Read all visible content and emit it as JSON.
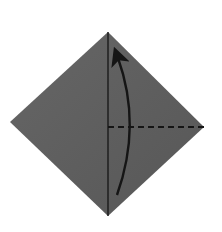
{
  "diagram": {
    "type": "origami-fold-step",
    "paper_color": "#5e5e5e",
    "paper_highlight": "#6a6a6a",
    "line_color": "#151515",
    "background": "#ffffff",
    "shape": {
      "name": "diamond",
      "top": [
        108,
        32
      ],
      "left": [
        10,
        122
      ],
      "right": [
        204,
        127
      ],
      "bottom": [
        108,
        216
      ]
    },
    "crease": {
      "name": "center-crease",
      "from": [
        108,
        32
      ],
      "to": [
        108,
        216
      ]
    },
    "fold_line": {
      "name": "valley-fold-dashed",
      "from": [
        108,
        127
      ],
      "to": [
        204,
        127
      ]
    },
    "arrow": {
      "name": "fold-up-arrow",
      "start": [
        117,
        195
      ],
      "control": [
        142,
        125
      ],
      "end": [
        118,
        58
      ]
    }
  }
}
